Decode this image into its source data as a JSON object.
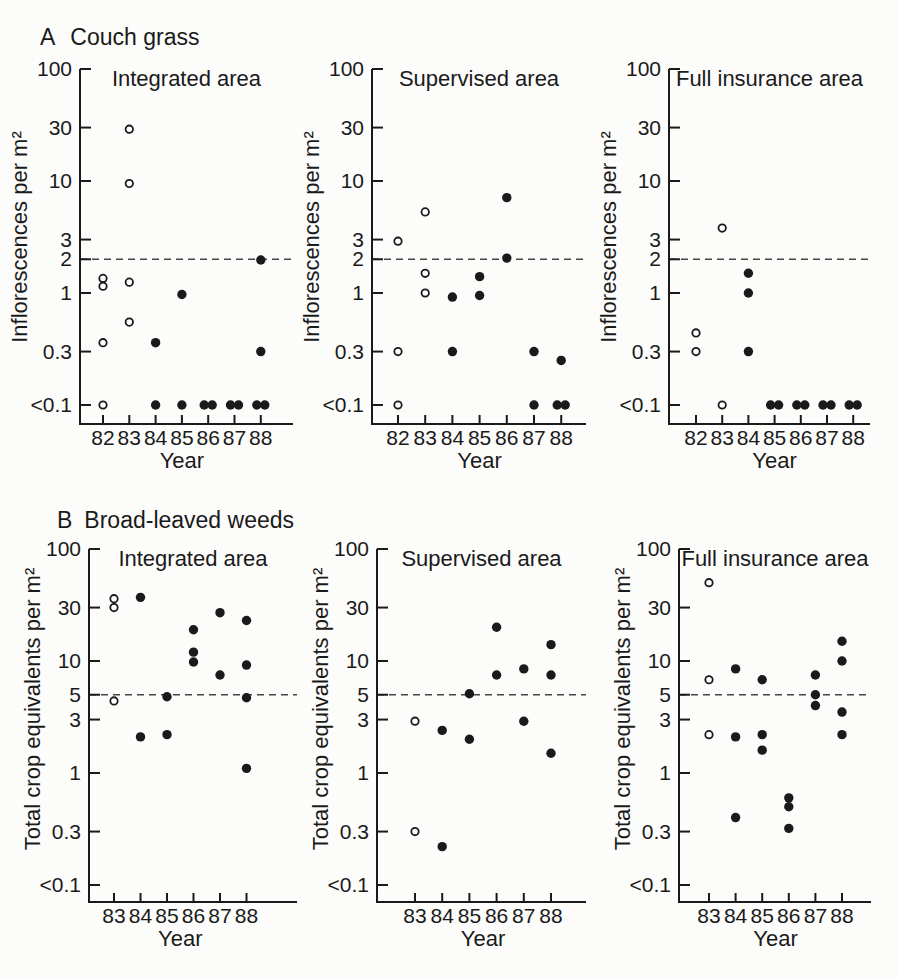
{
  "figure": {
    "ink": "#1a1a1a",
    "paper": "#fcfcfa",
    "dash_color": "#454545",
    "marker_open_fill": "#ffffff"
  },
  "chart_data": [
    {
      "type": "scatter",
      "row_label": "A",
      "row_title": "Couch grass",
      "ylabel": "Inflorescences per m²",
      "xlabel": "Year",
      "yscale": "log",
      "ylim": [
        0.1,
        100
      ],
      "dashed_line_at": 2,
      "yticks": [
        {
          "label": "100",
          "value": 100
        },
        {
          "label": "30",
          "value": 30
        },
        {
          "label": "10",
          "value": 10
        },
        {
          "label": "3",
          "value": 3
        },
        {
          "label": "2",
          "value": 2
        },
        {
          "label": "1",
          "value": 1
        },
        {
          "label": "0.3",
          "value": 0.3
        },
        {
          "label": "<0.1",
          "value": 0.1
        }
      ],
      "years": [
        "82",
        "83",
        "84",
        "85",
        "86",
        "87",
        "88"
      ],
      "panels": [
        {
          "title": "Integrated area",
          "points": [
            {
              "year": "82",
              "value": 1.35,
              "marker": "open"
            },
            {
              "year": "82",
              "value": 1.15,
              "marker": "open"
            },
            {
              "year": "82",
              "value": 0.36,
              "marker": "open"
            },
            {
              "year": "82",
              "value": 0.1,
              "marker": "open"
            },
            {
              "year": "83",
              "value": 29,
              "marker": "open"
            },
            {
              "year": "83",
              "value": 9.5,
              "marker": "open"
            },
            {
              "year": "83",
              "value": 1.25,
              "marker": "open"
            },
            {
              "year": "83",
              "value": 0.55,
              "marker": "open"
            },
            {
              "year": "84",
              "value": 0.36,
              "marker": "filled"
            },
            {
              "year": "84",
              "value": 0.1,
              "marker": "filled"
            },
            {
              "year": "85",
              "value": 0.97,
              "marker": "filled"
            },
            {
              "year": "85",
              "value": 0.1,
              "marker": "filled"
            },
            {
              "year": "86",
              "value": 0.1,
              "marker": "filled",
              "dx": -4
            },
            {
              "year": "86",
              "value": 0.1,
              "marker": "filled",
              "dx": 4
            },
            {
              "year": "87",
              "value": 0.1,
              "marker": "filled",
              "dx": -4
            },
            {
              "year": "87",
              "value": 0.1,
              "marker": "filled",
              "dx": 4
            },
            {
              "year": "88",
              "value": 1.97,
              "marker": "filled"
            },
            {
              "year": "88",
              "value": 0.3,
              "marker": "filled"
            },
            {
              "year": "88",
              "value": 0.1,
              "marker": "filled",
              "dx": -4
            },
            {
              "year": "88",
              "value": 0.1,
              "marker": "filled",
              "dx": 4
            }
          ]
        },
        {
          "title": "Supervised area",
          "points": [
            {
              "year": "82",
              "value": 2.9,
              "marker": "open"
            },
            {
              "year": "82",
              "value": 0.3,
              "marker": "open"
            },
            {
              "year": "82",
              "value": 0.1,
              "marker": "open"
            },
            {
              "year": "83",
              "value": 5.3,
              "marker": "open"
            },
            {
              "year": "83",
              "value": 1.5,
              "marker": "open"
            },
            {
              "year": "83",
              "value": 1.0,
              "marker": "open"
            },
            {
              "year": "84",
              "value": 0.92,
              "marker": "filled"
            },
            {
              "year": "84",
              "value": 0.3,
              "marker": "filled"
            },
            {
              "year": "85",
              "value": 1.4,
              "marker": "filled"
            },
            {
              "year": "85",
              "value": 0.95,
              "marker": "filled"
            },
            {
              "year": "86",
              "value": 7.1,
              "marker": "filled"
            },
            {
              "year": "86",
              "value": 2.05,
              "marker": "filled"
            },
            {
              "year": "87",
              "value": 0.3,
              "marker": "filled"
            },
            {
              "year": "87",
              "value": 0.1,
              "marker": "filled"
            },
            {
              "year": "88",
              "value": 0.25,
              "marker": "filled"
            },
            {
              "year": "88",
              "value": 0.1,
              "marker": "filled",
              "dx": -4
            },
            {
              "year": "88",
              "value": 0.1,
              "marker": "filled",
              "dx": 4
            }
          ]
        },
        {
          "title": "Full insurance area",
          "points": [
            {
              "year": "82",
              "value": 0.44,
              "marker": "open"
            },
            {
              "year": "82",
              "value": 0.3,
              "marker": "open"
            },
            {
              "year": "83",
              "value": 3.8,
              "marker": "open"
            },
            {
              "year": "83",
              "value": 0.1,
              "marker": "open"
            },
            {
              "year": "84",
              "value": 1.5,
              "marker": "filled"
            },
            {
              "year": "84",
              "value": 1.0,
              "marker": "filled"
            },
            {
              "year": "84",
              "value": 0.3,
              "marker": "filled"
            },
            {
              "year": "85",
              "value": 0.1,
              "marker": "filled",
              "dx": -4
            },
            {
              "year": "85",
              "value": 0.1,
              "marker": "filled",
              "dx": 4
            },
            {
              "year": "86",
              "value": 0.1,
              "marker": "filled",
              "dx": -4
            },
            {
              "year": "86",
              "value": 0.1,
              "marker": "filled",
              "dx": 4
            },
            {
              "year": "87",
              "value": 0.1,
              "marker": "filled",
              "dx": -4
            },
            {
              "year": "87",
              "value": 0.1,
              "marker": "filled",
              "dx": 4
            },
            {
              "year": "88",
              "value": 0.1,
              "marker": "filled",
              "dx": -4
            },
            {
              "year": "88",
              "value": 0.1,
              "marker": "filled",
              "dx": 4
            }
          ]
        }
      ]
    },
    {
      "type": "scatter",
      "row_label": "B",
      "row_title": "Broad-leaved weeds",
      "ylabel": "Total crop equivalents per m²",
      "xlabel": "Year",
      "yscale": "log",
      "ylim": [
        0.1,
        100
      ],
      "dashed_line_at": 5,
      "yticks": [
        {
          "label": "100",
          "value": 100
        },
        {
          "label": "30",
          "value": 30
        },
        {
          "label": "10",
          "value": 10
        },
        {
          "label": "5",
          "value": 5
        },
        {
          "label": "3",
          "value": 3
        },
        {
          "label": "1",
          "value": 1
        },
        {
          "label": "0.3",
          "value": 0.3
        },
        {
          "label": "<0.1",
          "value": 0.1
        }
      ],
      "years": [
        "83",
        "84",
        "85",
        "86",
        "87",
        "88"
      ],
      "panels": [
        {
          "title": "Integrated area",
          "points": [
            {
              "year": "83",
              "value": 36,
              "marker": "open"
            },
            {
              "year": "83",
              "value": 30,
              "marker": "open"
            },
            {
              "year": "83",
              "value": 4.4,
              "marker": "open"
            },
            {
              "year": "84",
              "value": 37,
              "marker": "filled"
            },
            {
              "year": "84",
              "value": 2.1,
              "marker": "filled"
            },
            {
              "year": "85",
              "value": 4.8,
              "marker": "filled"
            },
            {
              "year": "85",
              "value": 2.2,
              "marker": "filled"
            },
            {
              "year": "86",
              "value": 19,
              "marker": "filled"
            },
            {
              "year": "86",
              "value": 12,
              "marker": "filled"
            },
            {
              "year": "86",
              "value": 9.8,
              "marker": "filled"
            },
            {
              "year": "87",
              "value": 27,
              "marker": "filled"
            },
            {
              "year": "87",
              "value": 7.5,
              "marker": "filled"
            },
            {
              "year": "88",
              "value": 23,
              "marker": "filled"
            },
            {
              "year": "88",
              "value": 9.2,
              "marker": "filled"
            },
            {
              "year": "88",
              "value": 4.7,
              "marker": "filled"
            },
            {
              "year": "88",
              "value": 1.1,
              "marker": "filled"
            }
          ]
        },
        {
          "title": "Supervised area",
          "points": [
            {
              "year": "83",
              "value": 2.9,
              "marker": "open"
            },
            {
              "year": "83",
              "value": 0.3,
              "marker": "open"
            },
            {
              "year": "84",
              "value": 2.4,
              "marker": "filled"
            },
            {
              "year": "84",
              "value": 0.22,
              "marker": "filled"
            },
            {
              "year": "85",
              "value": 5.1,
              "marker": "filled"
            },
            {
              "year": "85",
              "value": 2.0,
              "marker": "filled"
            },
            {
              "year": "86",
              "value": 20,
              "marker": "filled"
            },
            {
              "year": "86",
              "value": 7.5,
              "marker": "filled"
            },
            {
              "year": "87",
              "value": 8.5,
              "marker": "filled"
            },
            {
              "year": "87",
              "value": 2.9,
              "marker": "filled"
            },
            {
              "year": "88",
              "value": 14,
              "marker": "filled"
            },
            {
              "year": "88",
              "value": 7.5,
              "marker": "filled"
            },
            {
              "year": "88",
              "value": 1.5,
              "marker": "filled"
            }
          ]
        },
        {
          "title": "Full insurance area",
          "points": [
            {
              "year": "83",
              "value": 50,
              "marker": "open"
            },
            {
              "year": "83",
              "value": 6.8,
              "marker": "open"
            },
            {
              "year": "83",
              "value": 2.2,
              "marker": "open"
            },
            {
              "year": "84",
              "value": 8.5,
              "marker": "filled"
            },
            {
              "year": "84",
              "value": 2.1,
              "marker": "filled"
            },
            {
              "year": "84",
              "value": 0.4,
              "marker": "filled"
            },
            {
              "year": "85",
              "value": 6.8,
              "marker": "filled"
            },
            {
              "year": "85",
              "value": 2.2,
              "marker": "filled"
            },
            {
              "year": "85",
              "value": 1.6,
              "marker": "filled"
            },
            {
              "year": "86",
              "value": 0.6,
              "marker": "filled"
            },
            {
              "year": "86",
              "value": 0.5,
              "marker": "filled"
            },
            {
              "year": "86",
              "value": 0.32,
              "marker": "filled"
            },
            {
              "year": "87",
              "value": 7.5,
              "marker": "filled"
            },
            {
              "year": "87",
              "value": 5.0,
              "marker": "filled"
            },
            {
              "year": "87",
              "value": 4.0,
              "marker": "filled"
            },
            {
              "year": "88",
              "value": 15,
              "marker": "filled"
            },
            {
              "year": "88",
              "value": 10,
              "marker": "filled"
            },
            {
              "year": "88",
              "value": 3.5,
              "marker": "filled"
            },
            {
              "year": "88",
              "value": 2.2,
              "marker": "filled"
            }
          ]
        }
      ]
    }
  ]
}
